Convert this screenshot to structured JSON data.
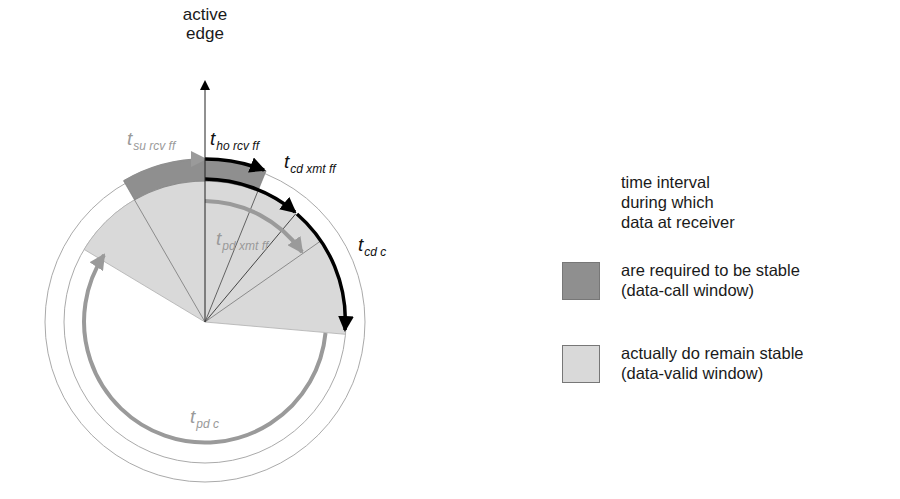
{
  "diagram": {
    "axis_title_line1": "active",
    "axis_title_line2": "edge",
    "labels": {
      "t_su_rcv_ff": {
        "main": "t",
        "sub": "su rcv ff"
      },
      "t_ho_rcv_ff": {
        "main": "t",
        "sub": "ho rcv ff"
      },
      "t_cd_xmt_ff": {
        "main": "t",
        "sub": "cd xmt ff"
      },
      "t_cd_c": {
        "main": "t",
        "sub": "cd c"
      },
      "t_pd_xmt_ff": {
        "main": "t",
        "sub": "pd xmt ff"
      },
      "t_pd_c": {
        "main": "t",
        "sub": "pd c"
      }
    },
    "colors": {
      "data_call_window": "#8f8f8f",
      "data_valid_window": "#d9d9d9",
      "gray_arrow": "#9a9a9a",
      "black_arrow": "#000000"
    }
  },
  "legend": {
    "title_line1": "time interval",
    "title_line2": "during which",
    "title_line3": "data at receiver",
    "items": [
      {
        "line1": "are required to be stable",
        "line2": "(data-call window)"
      },
      {
        "line1": "actually do remain stable",
        "line2": "(data-valid window)"
      }
    ]
  }
}
